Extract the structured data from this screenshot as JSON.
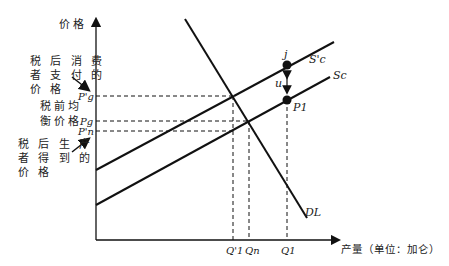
{
  "diagram": {
    "y_axis_label": "价格",
    "x_axis_label": "产量（单位：加仑）",
    "annotations": {
      "consumer_price": "税后消费者支付的价格",
      "consumer_price_lines": [
        "税 后 消 费",
        "者 支 付 的",
        "价 格"
      ],
      "equilibrium_price_lines": [
        "税前均",
        "衡价格"
      ],
      "producer_price_lines": [
        "税 后 生 产",
        "者 得 到 的",
        "价 格"
      ]
    },
    "price_ticks": [
      "P'g",
      "Pg",
      "P'n"
    ],
    "quantity_ticks": [
      "Q'1",
      "Qn",
      "Q1"
    ],
    "curves": {
      "supply_with_tax": "S'c",
      "supply": "Sc",
      "demand": "DL"
    },
    "points": {
      "upper": "j",
      "lower": "P1",
      "gap_label": "u"
    }
  }
}
